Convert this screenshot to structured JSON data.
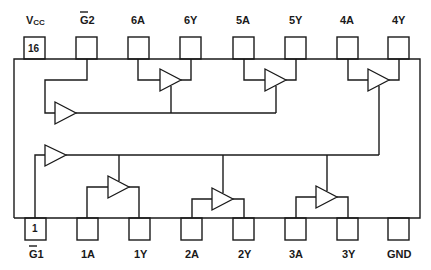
{
  "diagram": {
    "colors": {
      "line": "#1a1a1a",
      "background": "#ffffff"
    },
    "top_pins": [
      {
        "label": "VCC",
        "label_main": "V",
        "label_sub": "CC",
        "number": "16",
        "x": 24
      },
      {
        "label": "G2",
        "label_main": "G",
        "label_suffix": "2",
        "overbar": true,
        "x": 76
      },
      {
        "label": "6A",
        "x": 128
      },
      {
        "label": "6Y",
        "x": 180
      },
      {
        "label": "5A",
        "x": 233
      },
      {
        "label": "5Y",
        "x": 285
      },
      {
        "label": "4A",
        "x": 337
      },
      {
        "label": "4Y",
        "x": 388
      }
    ],
    "bottom_pins": [
      {
        "label": "G1",
        "label_main": "G",
        "label_suffix": "1",
        "overbar": true,
        "number": "1",
        "x": 25
      },
      {
        "label": "1A",
        "x": 77
      },
      {
        "label": "1Y",
        "x": 129
      },
      {
        "label": "2A",
        "x": 181
      },
      {
        "label": "2Y",
        "x": 233
      },
      {
        "label": "3A",
        "x": 285
      },
      {
        "label": "3Y",
        "x": 337
      },
      {
        "label": "GND",
        "x": 388
      }
    ],
    "buffers": [
      {
        "name": "enable-buffer-g2",
        "input": "G2",
        "drives": [
          "6",
          "5"
        ]
      },
      {
        "name": "buffer-6",
        "input": "6A",
        "output": "6Y",
        "enable": "G2"
      },
      {
        "name": "buffer-5",
        "input": "5A",
        "output": "5Y",
        "enable": "G2"
      },
      {
        "name": "buffer-4",
        "input": "4A",
        "output": "4Y",
        "enable": "G1"
      },
      {
        "name": "enable-buffer-g1",
        "input": "G1",
        "drives": [
          "1",
          "2",
          "3",
          "4"
        ]
      },
      {
        "name": "buffer-1",
        "input": "1A",
        "output": "1Y",
        "enable": "G1"
      },
      {
        "name": "buffer-2",
        "input": "2A",
        "output": "2Y",
        "enable": "G1"
      },
      {
        "name": "buffer-3",
        "input": "3A",
        "output": "3Y",
        "enable": "G1"
      }
    ]
  }
}
